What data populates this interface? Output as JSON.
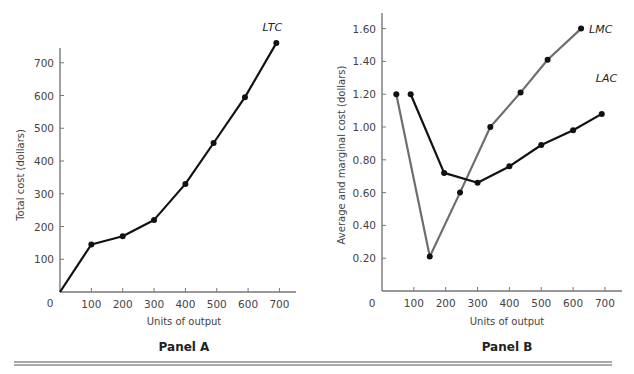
{
  "chart_data": [
    {
      "id": "panelA",
      "type": "line",
      "panel_title": "Panel A",
      "xlabel": "Units of output",
      "ylabel": "Total cost (dollars)",
      "xlim": [
        0,
        750
      ],
      "ylim": [
        0,
        760
      ],
      "xticks": [
        100,
        200,
        300,
        400,
        500,
        600,
        700
      ],
      "xtick_labels": [
        "100",
        "200",
        "300",
        "400",
        "500",
        "600",
        "700"
      ],
      "yticks": [
        100,
        200,
        300,
        400,
        500,
        600,
        700
      ],
      "ytick_labels": [
        "100",
        "200",
        "300",
        "400",
        "500",
        "600",
        "700"
      ],
      "origin_label": "0",
      "grid": false,
      "series": [
        {
          "name": "LTC",
          "color": "#111111",
          "x": [
            0,
            100,
            200,
            300,
            400,
            490,
            590,
            690
          ],
          "y": [
            0,
            145,
            170,
            220,
            330,
            455,
            595,
            760
          ],
          "markers": [
            false,
            true,
            true,
            true,
            true,
            true,
            true,
            true
          ]
        }
      ]
    },
    {
      "id": "panelB",
      "type": "line",
      "panel_title": "Panel B",
      "xlabel": "Units of output",
      "ylabel": "Average and marginal cost (dollars)",
      "xlim": [
        0,
        750
      ],
      "ylim": [
        0,
        1.7
      ],
      "xticks": [
        100,
        200,
        300,
        400,
        500,
        600,
        700
      ],
      "xtick_labels": [
        "100",
        "200",
        "300",
        "400",
        "500",
        "600",
        "700"
      ],
      "yticks": [
        0.2,
        0.4,
        0.6,
        0.8,
        1.0,
        1.2,
        1.4,
        1.6
      ],
      "ytick_labels": [
        "0.20",
        "0.40",
        "0.60",
        "0.80",
        "1.00",
        "1.20",
        "1.40",
        "1.60"
      ],
      "origin_label": "0",
      "grid": false,
      "series": [
        {
          "name": "LMC",
          "color": "#6e6e6e",
          "x": [
            45,
            150,
            245,
            340,
            435,
            520,
            625
          ],
          "y": [
            1.2,
            0.21,
            0.6,
            1.0,
            1.21,
            1.41,
            1.6
          ],
          "markers": [
            true,
            true,
            true,
            true,
            true,
            true,
            true
          ]
        },
        {
          "name": "LAC",
          "color": "#111111",
          "x": [
            90,
            195,
            300,
            400,
            500,
            600,
            690
          ],
          "y": [
            1.2,
            0.72,
            0.66,
            0.76,
            0.89,
            0.98,
            1.08
          ],
          "markers": [
            true,
            true,
            true,
            true,
            true,
            true,
            true
          ]
        }
      ]
    }
  ]
}
